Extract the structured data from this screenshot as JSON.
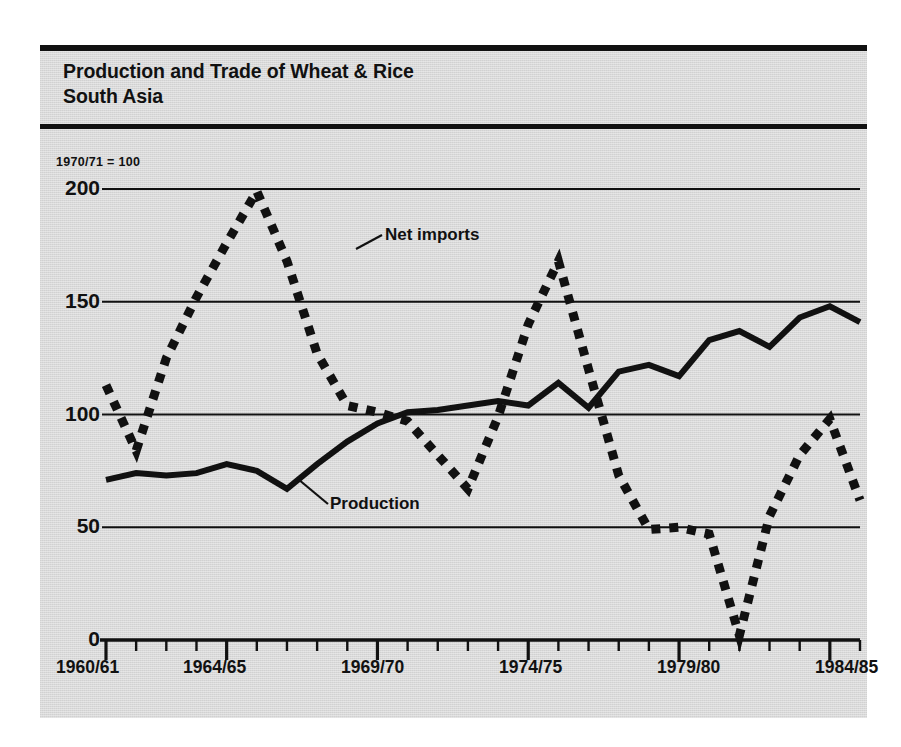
{
  "figure": {
    "title": "Production and Trade of Wheat & Rice\nSouth Asia",
    "index_note": "1970/71 = 100",
    "panel_color": "#d9d9d9",
    "ink_color": "#111111"
  },
  "chart_data": {
    "type": "line",
    "title": "Production and Trade of Wheat & Rice South Asia",
    "subtitle": "1970/71 = 100",
    "xlabel": "",
    "ylabel": "",
    "ylim": [
      0,
      210
    ],
    "yticks": [
      0,
      50,
      100,
      150,
      200
    ],
    "ytick_labels": [
      "0",
      "50",
      "100",
      "150",
      "200"
    ],
    "grid": "horizontal",
    "legend": "inline-annotations",
    "x": [
      "1960/61",
      "1961/62",
      "1962/63",
      "1963/64",
      "1964/65",
      "1965/66",
      "1966/67",
      "1967/68",
      "1968/69",
      "1969/70",
      "1970/71",
      "1971/72",
      "1972/73",
      "1973/74",
      "1974/75",
      "1975/76",
      "1976/77",
      "1977/78",
      "1978/79",
      "1979/80",
      "1980/81",
      "1981/82",
      "1982/83",
      "1983/84",
      "1984/85",
      "1985/86"
    ],
    "xtick_labels": [
      "1960/61",
      "1964/65",
      "1969/70",
      "1974/75",
      "1979/80",
      "1984/85"
    ],
    "xtick_label_indices": [
      0,
      4,
      9,
      14,
      19,
      24
    ],
    "series": [
      {
        "name": "Production",
        "style": "solid",
        "values": [
          71,
          74,
          73,
          74,
          78,
          75,
          67,
          78,
          88,
          96,
          101,
          102,
          104,
          106,
          104,
          114,
          103,
          119,
          122,
          117,
          133,
          137,
          130,
          143,
          148,
          141
        ]
      },
      {
        "name": "Net imports",
        "style": "dotted",
        "values": [
          113,
          84,
          125,
          152,
          176,
          199,
          168,
          127,
          104,
          101,
          97,
          82,
          67,
          99,
          140,
          168,
          120,
          73,
          49,
          50,
          47,
          2,
          55,
          82,
          98,
          62
        ]
      }
    ],
    "annotations": [
      {
        "text": "Net imports",
        "series": "Net imports"
      },
      {
        "text": "Production",
        "series": "Production"
      }
    ]
  },
  "axis": {
    "ylabels": [
      "200",
      "150",
      "100",
      "50",
      "0"
    ],
    "xlabels": [
      "1960/61",
      "1964/65",
      "1969/70",
      "1974/75",
      "1979/80",
      "1984/85"
    ]
  },
  "labels": {
    "net_imports": "Net imports",
    "production": "Production"
  }
}
